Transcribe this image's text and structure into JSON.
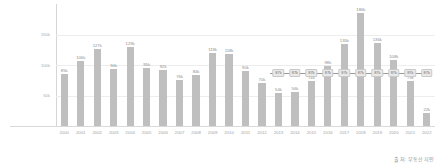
{
  "chart_data": {
    "type": "bar",
    "title": "",
    "xlabel": "",
    "ylabel": "",
    "ylim": [
      0,
      200000
    ],
    "grid": true,
    "legend": "none",
    "categories": [
      "2000",
      "2001",
      "2002",
      "2003",
      "2004",
      "2005",
      "2006",
      "2007",
      "2008",
      "2009",
      "2010",
      "2011",
      "2012",
      "2013",
      "2014",
      "2015",
      "2016",
      "2017",
      "2018",
      "2019",
      "2020",
      "2021",
      "2022"
    ],
    "tick_labels": [
      "50k",
      "100k",
      "150k"
    ],
    "tick_values": [
      50000,
      100000,
      150000
    ],
    "series": [
      {
        "name": "입주물량",
        "type": "bar",
        "values": [
          85000,
          106000,
          127000,
          94000,
          129000,
          95000,
          92000,
          76000,
          84000,
          119000,
          118000,
          90000,
          70000,
          54000,
          56000,
          74000,
          98000,
          135000,
          186000,
          136000,
          108000,
          73000,
          22000
        ],
        "labels": [
          "85k",
          "106k",
          "127k",
          "94k",
          "129k",
          "95k",
          "92k",
          "76k",
          "84k",
          "119k",
          "118k",
          "90k",
          "70k",
          "54k",
          "56k",
          "74k",
          "98k",
          "135k",
          "186k",
          "136k",
          "108k",
          "73k",
          "22k"
        ]
      },
      {
        "name": "수요량",
        "type": "line",
        "x": [
          "2013",
          "2014",
          "2015",
          "2016",
          "2017",
          "2018",
          "2019",
          "2020",
          "2021",
          "2022"
        ],
        "values": [
          87000,
          87000,
          87000,
          87000,
          87000,
          87000,
          87000,
          87000,
          87000,
          87000
        ],
        "labels": [
          "87k",
          "87k",
          "87k",
          "87k",
          "87k",
          "87k",
          "87k",
          "87k",
          "87k",
          "87k"
        ]
      }
    ],
    "source": "출처: 부동산지인",
    "colors": {
      "bar": "#bfbfbf",
      "line": "#9a9a9a",
      "point_box_fill": "#e9e9e9",
      "point_box_border": "#c9c9c9",
      "grid": "#ededed",
      "axis": "#d6d6d6",
      "label_text": "#8c8c8c",
      "tick_text": "#a9a9a9"
    }
  }
}
